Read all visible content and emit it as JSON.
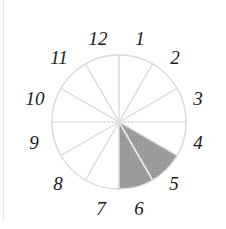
{
  "diagram": {
    "type": "clock-sector-diagram",
    "center": [
      119,
      122
    ],
    "radius": 67,
    "segments": 12,
    "labels": [
      "12",
      "1",
      "2",
      "3",
      "4",
      "5",
      "6",
      "7",
      "8",
      "9",
      "10",
      "11"
    ],
    "shaded_sectors": [
      {
        "from": "4",
        "to": "5"
      },
      {
        "from": "5",
        "to": "6"
      }
    ],
    "colors": {
      "outline": "#d9d9d9",
      "spokes": "#d9d9d9",
      "shade": "#9a9a9a",
      "shade_spoke": "#e6e6e6",
      "label": "#1a1a1a"
    }
  }
}
